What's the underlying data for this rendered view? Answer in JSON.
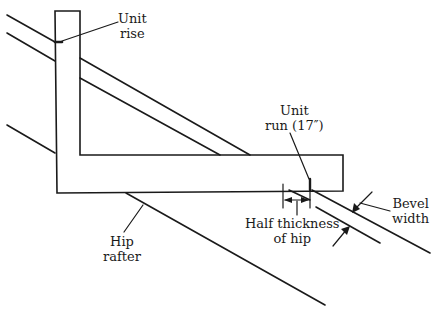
{
  "diagram": {
    "stroke_color": "#1a1a1a",
    "background_color": "#ffffff",
    "labels": {
      "unit_rise": {
        "line1": "Unit",
        "line2": "rise"
      },
      "unit_run": {
        "line1": "Unit",
        "line2": "run (17″)"
      },
      "bevel_width": {
        "line1": "Bevel",
        "line2": "width"
      },
      "half_thickness": {
        "line1": "Half thickness",
        "line2": "of hip"
      },
      "hip_rafter": {
        "line1": "Hip",
        "line2": "rafter"
      }
    }
  }
}
